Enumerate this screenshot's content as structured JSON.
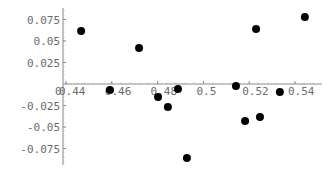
{
  "chart_data": {
    "type": "scatter",
    "title": "",
    "xlabel": "",
    "ylabel": "",
    "grid": false,
    "legend": null,
    "xlim": [
      0.4387,
      0.55
    ],
    "ylim": [
      -0.095,
      0.085
    ],
    "x_ticks": [
      0.44,
      0.46,
      0.48,
      0.5,
      0.52,
      0.54
    ],
    "x_tick_labels": [
      "0.44",
      "0.46",
      "0.48",
      "0.5",
      "0.52",
      "0.54"
    ],
    "y_ticks": [
      0.075,
      0.05,
      0.025,
      -0.025,
      -0.05,
      -0.075
    ],
    "y_tick_labels": [
      "0.075",
      "0.05",
      "0.025",
      "-0.025",
      "-0.05",
      "-0.075"
    ],
    "origin_label": "0",
    "series": [
      {
        "name": "points",
        "color": "#000000",
        "x": [
          0.4466,
          0.4592,
          0.4719,
          0.4802,
          0.4845,
          0.4889,
          0.4928,
          0.5142,
          0.5182,
          0.523,
          0.5247,
          0.5334,
          0.5443
        ],
        "y": [
          0.0616,
          -0.007,
          0.0419,
          -0.0151,
          -0.0267,
          -0.0058,
          -0.086,
          -0.0023,
          -0.043,
          0.064,
          -0.0384,
          -0.0093,
          0.0779
        ]
      }
    ]
  }
}
